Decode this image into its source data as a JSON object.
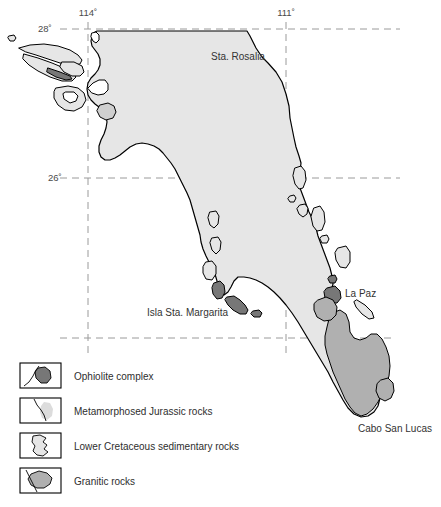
{
  "figure": {
    "background_color": "#ffffff"
  },
  "colors": {
    "sedimentary_light_gray": "#e6e6e6",
    "granitic_mid_gray": "#b0b0b0",
    "ophiolite_dark_gray": "#777777",
    "metamorphic_gray": "#cfcfcf",
    "coastline_black": "#000000",
    "grid_gray": "#9a9a9a",
    "text_gray": "#3a3a3a"
  },
  "graticule": {
    "latitudes": [
      {
        "label": "28˚",
        "y": 29,
        "x_start": 60,
        "x_end": 400,
        "label_x": 38,
        "label_y": 32
      },
      {
        "label": "26˚",
        "y": 178,
        "x_start": 60,
        "x_end": 400,
        "label_x": 48,
        "label_y": 181
      },
      {
        "label": "",
        "y": 338,
        "x_start": 60,
        "x_end": 392,
        "label_x": 0,
        "label_y": 0
      }
    ],
    "longitudes": [
      {
        "label": "114˚",
        "x": 88,
        "y_start": 22,
        "y_end": 358,
        "label_x": 88,
        "label_y": 16
      },
      {
        "label": "111˚",
        "x": 286,
        "y_start": 22,
        "y_end": 358,
        "label_x": 286,
        "label_y": 16
      }
    ]
  },
  "place_labels": [
    {
      "name": "Sta. Rosalia",
      "text": "Sta. Rosalia",
      "x": 211,
      "y": 60,
      "anchor": "start"
    },
    {
      "name": "La Paz",
      "text": "La Paz",
      "x": 345,
      "y": 297,
      "anchor": "start"
    },
    {
      "name": "Isla Sta. Margarita",
      "text": "Isla Sta. Margarita",
      "x": 147,
      "y": 316,
      "anchor": "start"
    },
    {
      "name": "Cabo San Lucas",
      "text": "Cabo San Lucas",
      "x": 358,
      "y": 432,
      "anchor": "start"
    }
  ],
  "legend": {
    "items": [
      {
        "key": "ophiolite",
        "label": "Ophiolite complex",
        "swatch": "ophiolite-swatch",
        "box_x": 20,
        "box_y": 363,
        "box_w": 41,
        "box_h": 25,
        "text_x": 74,
        "text_y": 380
      },
      {
        "key": "metamorphic",
        "label": "Metamorphosed Jurassic rocks",
        "swatch": "metamorphic-swatch",
        "box_x": 20,
        "box_y": 398,
        "box_w": 41,
        "box_h": 25,
        "text_x": 74,
        "text_y": 415
      },
      {
        "key": "cretaceous",
        "label": "Lower Cretaceous sedimentary rocks",
        "swatch": "cretaceous-swatch",
        "box_x": 20,
        "box_y": 433,
        "box_w": 41,
        "box_h": 25,
        "text_x": 74,
        "text_y": 450
      },
      {
        "key": "granitic",
        "label": "Granitic rocks",
        "swatch": "granitic-swatch",
        "box_x": 20,
        "box_y": 468,
        "box_w": 41,
        "box_h": 25,
        "text_x": 74,
        "text_y": 485
      }
    ]
  }
}
